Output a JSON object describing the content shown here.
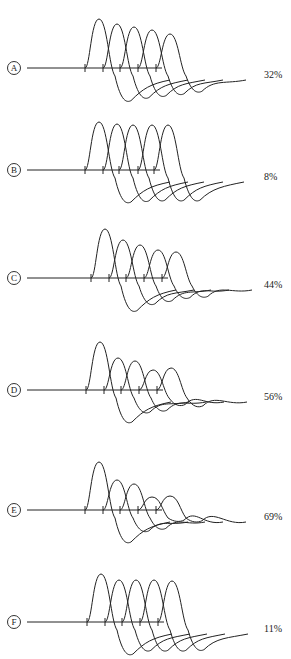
{
  "figure": {
    "panels": [
      {
        "id": "A",
        "letter": "A",
        "percent": "32%",
        "top": 0,
        "baseline_y": 68,
        "ticks": [
          85,
          103,
          120,
          138,
          156
        ],
        "peak_heights": [
          49,
          44,
          41,
          38,
          34
        ],
        "trough_depth": 30
      },
      {
        "id": "B",
        "letter": "B",
        "percent": "8%",
        "top": 110,
        "baseline_y": 60,
        "ticks": [
          85,
          103,
          119,
          138,
          154
        ],
        "peak_heights": [
          48,
          46,
          45,
          45,
          45
        ],
        "trough_depth": 30
      },
      {
        "id": "C",
        "letter": "C",
        "percent": "44%",
        "top": 220,
        "baseline_y": 58,
        "ticks": [
          91,
          109,
          126,
          144,
          162
        ],
        "peak_heights": [
          49,
          38,
          33,
          28,
          26
        ],
        "trough_depth": 30
      },
      {
        "id": "D",
        "letter": "D",
        "percent": "56%",
        "top": 330,
        "baseline_y": 60,
        "ticks": [
          86,
          104,
          121,
          139,
          157
        ],
        "peak_heights": [
          48,
          32,
          29,
          20,
          22
        ],
        "trough_depth": 30
      },
      {
        "id": "E",
        "letter": "E",
        "percent": "69%",
        "top": 440,
        "baseline_y": 70,
        "ticks": [
          85,
          103,
          120,
          138,
          156
        ],
        "peak_heights": [
          48,
          30,
          26,
          13,
          14
        ],
        "trough_depth": 30
      },
      {
        "id": "F",
        "letter": "F",
        "percent": "11%",
        "top": 549,
        "baseline_y": 73,
        "ticks": [
          87,
          105,
          122,
          140,
          158
        ],
        "peak_heights": [
          48,
          42,
          42,
          42,
          41
        ],
        "trough_depth": 30
      }
    ]
  }
}
